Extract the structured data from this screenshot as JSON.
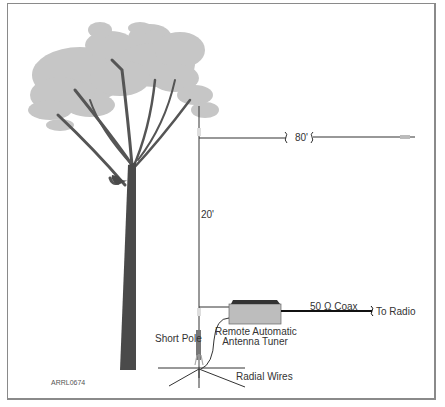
{
  "diagram": {
    "figure_id": "ARRL0674",
    "labels": {
      "horizontal_length": "80'",
      "vertical_length": "20'",
      "coax": "50 Ω Coax",
      "to_radio": "To Radio",
      "tuner_line1": "Remote Automatic",
      "tuner_line2": "Antenna Tuner",
      "short_pole": "Short Pole",
      "radials": "Radial Wires"
    },
    "components": [
      "tree",
      "vertical wire (20')",
      "horizontal wire (80')",
      "end insulator",
      "remote automatic antenna tuner",
      "50 Ω coax to radio",
      "short pole",
      "ground radial wires"
    ],
    "colors": {
      "foliage": "#c4c4c4",
      "trunk": "#4a4a4a",
      "wire": "#333333",
      "tuner_body": "#b8b8b8",
      "tuner_top": "#3a3a3a",
      "frame": "#8a8a8a"
    }
  }
}
